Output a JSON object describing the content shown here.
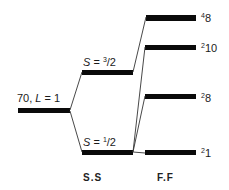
{
  "diagram": {
    "initial_level": {
      "label_prefix": "70, ",
      "label_L": "L",
      "label_suffix": " = 1"
    },
    "spin_split": {
      "column_label": "S.S",
      "levels": [
        {
          "id": "s32",
          "label_S": "S",
          "eq": " = ",
          "sup": "3",
          "den": "/2"
        },
        {
          "id": "s12",
          "label_S": "S",
          "eq": " = ",
          "sup": "1",
          "den": "/2"
        }
      ]
    },
    "flavor_split": {
      "column_label": "F.F",
      "levels": [
        {
          "id": "4_8",
          "mult": "4",
          "rep": "8"
        },
        {
          "id": "2_10",
          "mult": "2",
          "rep": "10"
        },
        {
          "id": "2_8",
          "mult": "2",
          "rep": "8"
        },
        {
          "id": "2_1",
          "mult": "2",
          "rep": "1"
        }
      ]
    },
    "colors": {
      "bar": "#0a0a0a",
      "line": "#333333",
      "background": "#ffffff"
    }
  }
}
